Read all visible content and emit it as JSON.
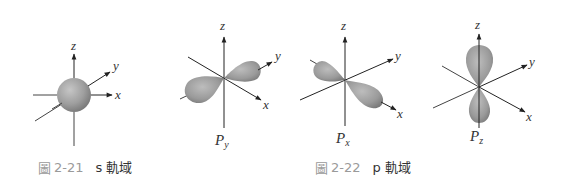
{
  "figure_21": {
    "number_prefix": "圖",
    "number": "2-21",
    "title": "s 軌域",
    "orbital": {
      "name": "s",
      "axes": {
        "x": "x",
        "y": "y",
        "z": "z"
      }
    }
  },
  "figure_22": {
    "number_prefix": "圖",
    "number": "2-22",
    "title": "p 軌域",
    "orbitals": [
      {
        "name": "P",
        "subscript": "y",
        "axes": {
          "x": "x",
          "y": "y",
          "z": "z"
        }
      },
      {
        "name": "P",
        "subscript": "x",
        "axes": {
          "x": "x",
          "y": "y",
          "z": "z"
        }
      },
      {
        "name": "P",
        "subscript": "z",
        "axes": {
          "x": "x",
          "y": "y",
          "z": "z"
        }
      }
    ]
  },
  "colors": {
    "lobe_light": "#c4c4c4",
    "lobe_mid": "#9c9c9c",
    "lobe_dark": "#6e6e6e",
    "axis": "#333333",
    "caption_number": "#9a9a9a",
    "caption_text": "#333333"
  }
}
